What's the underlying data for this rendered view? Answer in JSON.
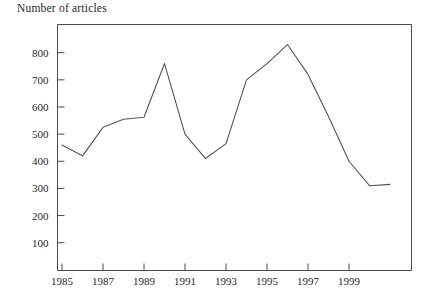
{
  "chart_data": {
    "type": "line",
    "title": "Number of articles",
    "xlabel": "",
    "ylabel": "",
    "grid": false,
    "legend": "none",
    "x": [
      1985,
      1986,
      1987,
      1988,
      1989,
      1990,
      1991,
      1992,
      1993,
      1994,
      1995,
      1996,
      1997,
      1998,
      1999,
      2000,
      2001
    ],
    "values": [
      460,
      420,
      525,
      555,
      562,
      760,
      500,
      410,
      465,
      700,
      760,
      830,
      720,
      565,
      400,
      310,
      315
    ],
    "series": [
      {
        "name": "Number of articles",
        "values": [
          460,
          420,
          525,
          555,
          562,
          760,
          500,
          410,
          465,
          700,
          760,
          830,
          720,
          565,
          400,
          310,
          315
        ]
      }
    ],
    "xlim": [
      1985,
      2001
    ],
    "ylim": [
      0,
      900
    ],
    "x_tick_labels": [
      "1985",
      "1987",
      "1989",
      "1991",
      "1993",
      "1995",
      "1997",
      "1999"
    ],
    "x_tick_values": [
      1985,
      1987,
      1989,
      1991,
      1993,
      1995,
      1997,
      1999
    ],
    "y_tick_labels": [
      "100",
      "200",
      "300",
      "400",
      "500",
      "600",
      "700",
      "800"
    ],
    "y_tick_values": [
      100,
      200,
      300,
      400,
      500,
      600,
      700,
      800
    ],
    "line_color": "#555555",
    "axis_color": "#4a4a4a"
  }
}
